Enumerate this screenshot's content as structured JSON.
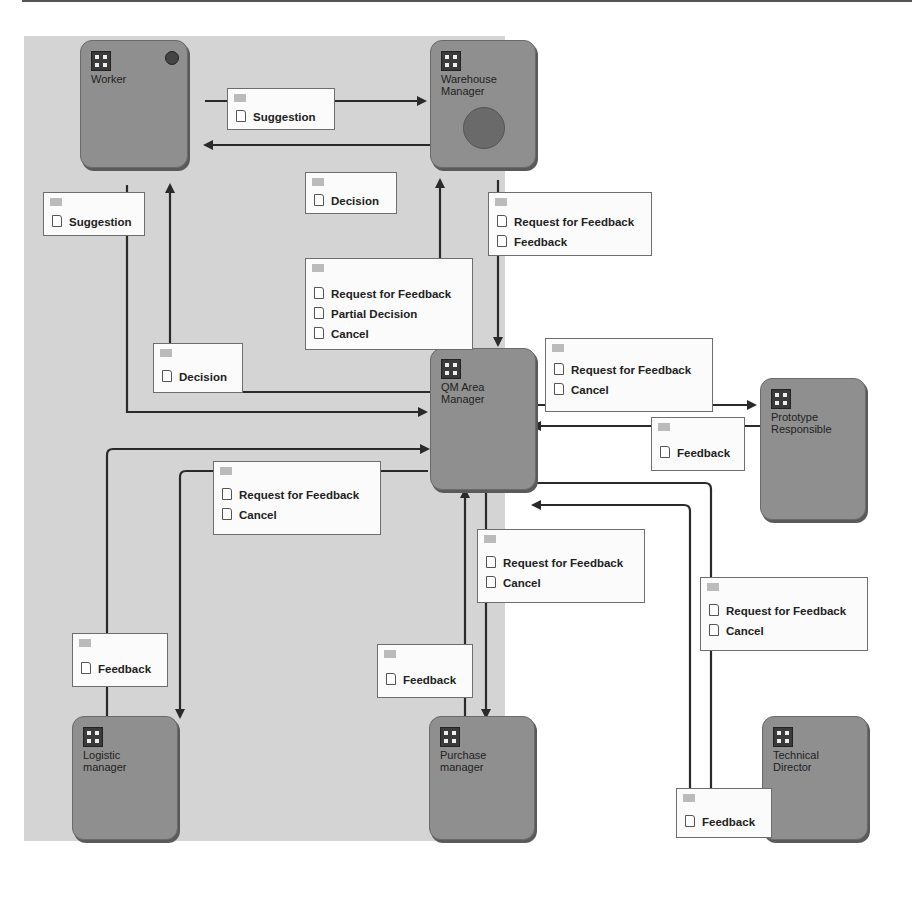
{
  "nodes": [
    {
      "id": "worker",
      "label": "Worker",
      "marker": "start-ball"
    },
    {
      "id": "warehouse",
      "label": "Warehouse Manager",
      "marker": "end-circle"
    },
    {
      "id": "qm",
      "label": "QM Area Manager"
    },
    {
      "id": "prototype",
      "label": "Prototype Responsible"
    },
    {
      "id": "logistic",
      "label": "Logistic manager"
    },
    {
      "id": "purchase",
      "label": "Purchase manager"
    },
    {
      "id": "technical",
      "label": "Technical Director"
    }
  ],
  "messages": [
    {
      "id": "m1",
      "items": [
        "Suggestion"
      ]
    },
    {
      "id": "m2",
      "items": [
        "Decision"
      ]
    },
    {
      "id": "m3",
      "items": [
        "Suggestion"
      ]
    },
    {
      "id": "m4",
      "items": [
        "Request for Feedback",
        "Feedback"
      ]
    },
    {
      "id": "m5",
      "items": [
        "Request for Feedback",
        "Partial Decision",
        "Cancel"
      ]
    },
    {
      "id": "m6",
      "items": [
        "Decision"
      ]
    },
    {
      "id": "m7",
      "items": [
        "Request for Feedback",
        "Cancel"
      ]
    },
    {
      "id": "m8",
      "items": [
        "Feedback"
      ]
    },
    {
      "id": "m9",
      "items": [
        "Request for Feedback",
        "Cancel"
      ]
    },
    {
      "id": "m10",
      "items": [
        "Request for Feedback",
        "Cancel"
      ]
    },
    {
      "id": "m11",
      "items": [
        "Request for Feedback",
        "Cancel"
      ]
    },
    {
      "id": "m12",
      "items": [
        "Feedback"
      ]
    },
    {
      "id": "m13",
      "items": [
        "Feedback"
      ]
    },
    {
      "id": "m14",
      "items": [
        "Feedback"
      ]
    }
  ],
  "colors": {
    "canvas": "#d4d4d4",
    "node": "#8f8f8f",
    "wire": "#2a2a2a",
    "msg": "#fbfbfb"
  }
}
